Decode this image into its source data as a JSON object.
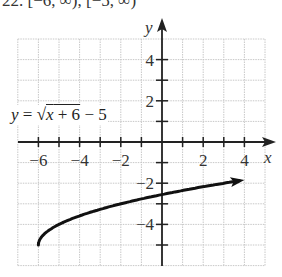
{
  "header": {
    "text": "22. [−6, ∞), [−5, ∞)"
  },
  "equation": {
    "lhs": "y",
    "equals": "=",
    "sqrt": "√",
    "radicand_var": "x",
    "radicand_rest": " + 6",
    "tail": " − 5"
  },
  "axes": {
    "x_label": "x",
    "y_label": "y"
  },
  "chart_data": {
    "type": "line",
    "title": "",
    "function": "y = sqrt(x + 6) - 5",
    "xlabel": "x",
    "ylabel": "y",
    "xlim": [
      -7,
      5
    ],
    "ylim": [
      -6,
      5
    ],
    "grid": true,
    "x_tick_labels": [
      "-6",
      "-4",
      "-2",
      "2",
      "4"
    ],
    "y_tick_labels": [
      "4",
      "2",
      "-2",
      "-4"
    ],
    "x": [
      -6,
      -5,
      -4,
      -3,
      -2,
      -1,
      0,
      1,
      2,
      3,
      4
    ],
    "y": [
      -5,
      -4,
      -3.59,
      -3.27,
      -3,
      -2.35,
      -2.55,
      -2.35,
      -2.17,
      -2,
      -1.84
    ],
    "series": [
      {
        "name": "y = √(x+6) − 5",
        "x": [
          -6,
          -5,
          -4,
          -3,
          -2,
          -1,
          0,
          1,
          2,
          3,
          4
        ],
        "y": [
          -5,
          -4,
          -3.59,
          -3.27,
          -3.0,
          -2.76,
          -2.55,
          -2.35,
          -2.17,
          -2.0,
          -1.84
        ]
      }
    ],
    "start_point": [
      -6,
      -5
    ],
    "arrow_end": [
      4,
      -1.84
    ],
    "annotations": [
      "y = √(x + 6) − 5"
    ]
  }
}
